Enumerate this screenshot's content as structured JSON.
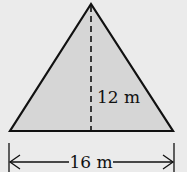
{
  "diagram": {
    "shape": "triangle",
    "fill_color": "#d6d6d6",
    "stroke_color": "#111111",
    "background_color": "#ebebeb",
    "height_label": "12 m",
    "base_label": "16 m"
  }
}
